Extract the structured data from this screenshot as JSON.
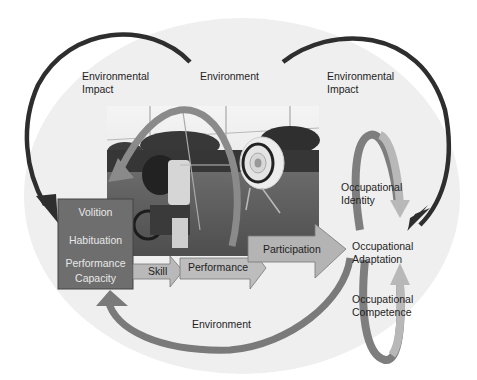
{
  "diagram": {
    "colors": {
      "background_ellipse": "#efefef",
      "volition_box": "#6e6e6e",
      "skill_arrow": "#b9b9b9",
      "performance_arrow": "#bdbdbd",
      "participation_arrow": "#b4b4b4",
      "environmental_impact_arrow": "#2e2e2e",
      "loop_arrow": "#7a7a7a",
      "spiral_light": "#b8b8b8",
      "spiral_dark": "#7e7e7e"
    },
    "labels": {
      "env_impact_left": [
        "Environmental",
        "Impact"
      ],
      "environment_top": "Environment",
      "env_impact_right": [
        "Environmental",
        "Impact"
      ],
      "environment_bottom": "Environment"
    },
    "person_box": {
      "volition": "Volition",
      "habituation": "Habituation",
      "performance_capacity": [
        "Performance",
        "Capacity"
      ]
    },
    "flow_arrows": {
      "skill": "Skill",
      "performance": "Performance",
      "participation": "Participation"
    },
    "outcomes": {
      "identity": [
        "Occupational",
        "Identity"
      ],
      "adaptation": [
        "Occupational",
        "Adaptation"
      ],
      "competence": [
        "Occupational",
        "Competence"
      ]
    },
    "photo": {
      "description": "Archer in wheelchair aiming bow at target on a field"
    }
  }
}
